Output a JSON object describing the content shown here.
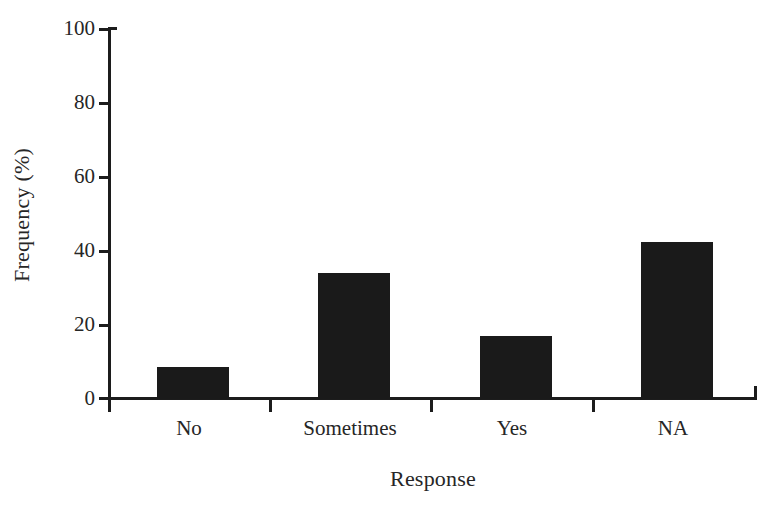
{
  "chart_data": {
    "type": "bar",
    "title": "",
    "subtitle": "",
    "xlabel": "Response",
    "ylabel": "Frequency (%)",
    "categories": [
      "No",
      "Sometimes",
      "Yes",
      "NA"
    ],
    "values": [
      8.6,
      34,
      17,
      42.5
    ],
    "series": [
      {
        "name": "Frequency",
        "values": [
          8.6,
          34,
          17,
          42.5
        ]
      }
    ],
    "ylim": [
      0,
      100
    ],
    "ytick_labels": [
      "0",
      "20",
      "40",
      "60",
      "80",
      "100"
    ],
    "ytick_values": [
      0,
      20,
      40,
      60,
      80,
      100
    ],
    "grid": false,
    "legend": "none",
    "bar_color": "#1a1a1a",
    "axis_color": "#1c1c1c",
    "background_color": "#ffffff"
  },
  "axes": {
    "y_title": "Frequency (%)",
    "x_title": "Response"
  },
  "ticks": {
    "y": [
      {
        "label": "100"
      },
      {
        "label": "80"
      },
      {
        "label": "60"
      },
      {
        "label": "40"
      },
      {
        "label": "20"
      },
      {
        "label": "0"
      }
    ],
    "x": [
      {
        "label": "No"
      },
      {
        "label": "Sometimes"
      },
      {
        "label": "Yes"
      },
      {
        "label": "NA"
      }
    ]
  },
  "bars": [
    {
      "category": "No",
      "value": 8.6
    },
    {
      "category": "Sometimes",
      "value": 34
    },
    {
      "category": "Yes",
      "value": 17
    },
    {
      "category": "NA",
      "value": 42.5
    }
  ]
}
